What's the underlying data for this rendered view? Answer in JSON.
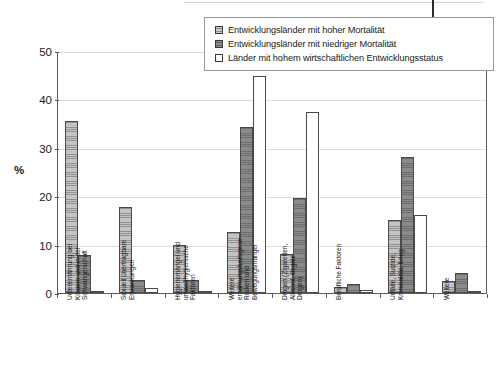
{
  "chart_data": {
    "type": "bar",
    "title": "",
    "subtitle": "",
    "xlabel": "",
    "ylabel": "%",
    "ylim": [
      0,
      50
    ],
    "yticks": [
      0,
      10,
      20,
      30,
      40,
      50
    ],
    "grid": true,
    "legend_position": "top-right",
    "categories": [
      "Unterernährung bei Kindern und in der Schwangerschaft",
      "Sexuell übertragbare Erkrankungen",
      "Hygienemängel und umwelthygienische Faktoren",
      "Weitere ernährungsbezogene Risiken und Bewegungsmangel",
      "Drogen (Zigaretten, Alkohol, illegale Drogen)",
      "Berufliche Faktoren",
      "Unfälle, Suizide, Kriminalität, Krieg",
      "Weitere"
    ],
    "category_lines": [
      [
        "Unterernährung bei",
        "Kindern und in der",
        "Schwangerschaft"
      ],
      [
        "Sexuell übertragbare",
        "Erkrankungen"
      ],
      [
        "Hygienemängel und",
        "umwelthygienische",
        "Faktoren"
      ],
      [
        "Weitere",
        "ernährungsbezogene",
        "Risiken und",
        "Bewegungsmangel"
      ],
      [
        "Drogen (Zigaretten,",
        "Alkohol, illegale",
        "Drogen)"
      ],
      [
        "Berufliche Faktoren"
      ],
      [
        "Unfälle, Suizide,",
        "Kriminalität, Krieg"
      ],
      [
        "Weitere"
      ]
    ],
    "series": [
      {
        "name": "Entwicklungsländer mit hoher Mortalität",
        "swatch": "light-hatched",
        "color": "#c4c4c4",
        "values": [
          35.5,
          17.8,
          10.0,
          12.7,
          8.0,
          1.3,
          15.0,
          2.5
        ]
      },
      {
        "name": "Entwicklungsländer mit niedriger Mortalität",
        "swatch": "dark-hatched",
        "color": "#8b8b8b",
        "values": [
          7.8,
          2.6,
          2.6,
          34.2,
          19.6,
          1.8,
          28.0,
          4.1
        ]
      },
      {
        "name": "Länder mit hohem wirtschaftlichen Entwicklungsstatus",
        "swatch": "white-empty",
        "color": "#ffffff",
        "values": [
          0.5,
          1.0,
          0.4,
          44.9,
          37.3,
          0.6,
          16.2,
          0.5
        ]
      }
    ]
  },
  "legend": {
    "items": [
      {
        "label": "Entwicklungsländer mit hoher Mortalität"
      },
      {
        "label": "Entwicklungsländer mit niedriger Mortalität"
      },
      {
        "label": "Länder mit hohem wirtschaftlichen Entwicklungsstatus"
      }
    ]
  },
  "axis": {
    "y_title": "%",
    "y_tick_labels": [
      "50",
      "40",
      "30",
      "20",
      "10",
      "0"
    ]
  }
}
